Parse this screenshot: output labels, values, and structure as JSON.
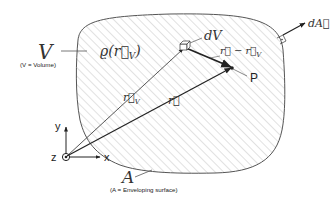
{
  "diagram": {
    "volume_label": "V",
    "volume_caption": "(V = Volume)",
    "density_label": "ϱ(r⃗",
    "density_sub": "V",
    "density_close": ")",
    "volume_element_label": "dV",
    "difference_vector_label": "r⃗ − r⃗",
    "difference_vector_sub": "V",
    "point_label": "P",
    "source_vector_label": "r⃗",
    "source_vector_sub": "V",
    "field_vector_label": "r⃗",
    "surface_label": "A",
    "surface_caption": "(A = Enveloping surface)",
    "area_element_label": "dA⃗",
    "axes": {
      "x": "x",
      "y": "y",
      "z": "z"
    },
    "colors": {
      "outline": "#555555",
      "hatch": "#d6d6d6",
      "vector": "#222222",
      "leader": "#666666"
    }
  }
}
